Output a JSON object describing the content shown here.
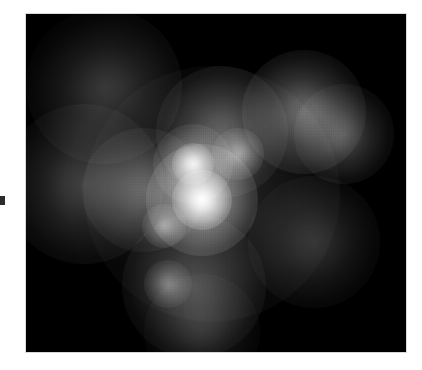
{
  "page": {
    "background_color": "#ffffff",
    "width": 422,
    "height": 370,
    "caption": "",
    "margin_mark": {
      "name": "margin-tick-mark",
      "color": "#2b2b2b",
      "x": 0,
      "y": 196,
      "width": 5,
      "height": 9
    }
  },
  "figure": {
    "title": "",
    "alt_text": "",
    "frame": {
      "x": 26,
      "y": 14,
      "width": 380,
      "height": 338,
      "background_color": "#000000",
      "border_color": "#d8d8d8"
    }
  },
  "chart_data": {
    "type": "heatmap",
    "title": "",
    "subtitle": "",
    "xlabel": "",
    "ylabel": "",
    "colormap": "grayscale",
    "background_color": "#000000",
    "peak_color": "#ffffff",
    "grid": false,
    "legend": false,
    "axis_ticks": false,
    "xlim": [
      0,
      380
    ],
    "ylim": [
      0,
      338
    ],
    "intensity_range": [
      0,
      255
    ],
    "sources": [
      {
        "label": "core-primary",
        "x": 176,
        "y": 186,
        "radius": 30,
        "intensity": 255
      },
      {
        "label": "core-primary-halo",
        "x": 176,
        "y": 186,
        "radius": 56,
        "intensity": 170
      },
      {
        "label": "core-secondary",
        "x": 167,
        "y": 150,
        "radius": 21,
        "intensity": 215
      },
      {
        "label": "core-secondary-halo",
        "x": 167,
        "y": 150,
        "radius": 40,
        "intensity": 120
      },
      {
        "label": "knot-northeast",
        "x": 212,
        "y": 140,
        "radius": 26,
        "intensity": 130
      },
      {
        "label": "knot-southwest",
        "x": 138,
        "y": 212,
        "radius": 22,
        "intensity": 120
      },
      {
        "label": "knot-south",
        "x": 142,
        "y": 270,
        "radius": 24,
        "intensity": 95
      },
      {
        "label": "clump-northeast",
        "x": 278,
        "y": 98,
        "radius": 62,
        "intensity": 105
      },
      {
        "label": "clump-east",
        "x": 318,
        "y": 120,
        "radius": 50,
        "intensity": 80
      },
      {
        "label": "arm-northwest",
        "x": 78,
        "y": 72,
        "radius": 78,
        "intensity": 60
      },
      {
        "label": "arm-west",
        "x": 58,
        "y": 170,
        "radius": 80,
        "intensity": 65
      },
      {
        "label": "bridge-center-west",
        "x": 118,
        "y": 176,
        "radius": 62,
        "intensity": 80
      },
      {
        "label": "bridge-center-north",
        "x": 196,
        "y": 118,
        "radius": 66,
        "intensity": 85
      },
      {
        "label": "arm-south",
        "x": 168,
        "y": 272,
        "radius": 72,
        "intensity": 70
      },
      {
        "label": "tail-south",
        "x": 176,
        "y": 318,
        "radius": 58,
        "intensity": 40
      },
      {
        "label": "extension-southeast",
        "x": 288,
        "y": 228,
        "radius": 66,
        "intensity": 48
      },
      {
        "label": "halo-diffuse",
        "x": 186,
        "y": 180,
        "radius": 128,
        "intensity": 42
      }
    ]
  }
}
